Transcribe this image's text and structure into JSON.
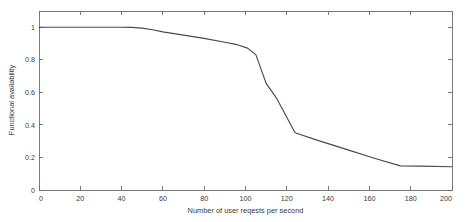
{
  "chart_data": {
    "type": "line",
    "title": "",
    "xlabel": "Number of user reqests per second",
    "ylabel": "Functional availability",
    "xlim": [
      0,
      200
    ],
    "ylim": [
      0,
      1.1
    ],
    "grid": false,
    "legend": null,
    "xticks": [
      0,
      20,
      40,
      60,
      80,
      100,
      120,
      140,
      160,
      180,
      200
    ],
    "xtick_labels": [
      "0",
      "20",
      "40",
      "60",
      "80",
      "100",
      "120",
      "140",
      "160",
      "180",
      "200"
    ],
    "yticks": [
      0,
      0.2,
      0.4,
      0.6,
      0.8,
      1
    ],
    "ytick_labels": [
      "0",
      "0.2",
      "0.4",
      "0.6",
      "0.8",
      "1"
    ],
    "series": [
      {
        "name": "Functional availability",
        "color": "#4a4a4a",
        "x": [
          0,
          10,
          20,
          30,
          40,
          45,
          50,
          55,
          60,
          70,
          80,
          90,
          96,
          101,
          105,
          110,
          115,
          124,
          135,
          150,
          162,
          175,
          185,
          200
        ],
        "y": [
          1.0,
          1.0,
          1.0,
          1.0,
          1.0,
          0.999,
          0.995,
          0.985,
          0.972,
          0.952,
          0.932,
          0.908,
          0.893,
          0.872,
          0.832,
          0.655,
          0.565,
          0.352,
          0.305,
          0.245,
          0.197,
          0.148,
          0.147,
          0.143
        ]
      }
    ]
  },
  "axes": {
    "x_axis_name": "x-axis",
    "y_axis_name": "y-axis"
  }
}
